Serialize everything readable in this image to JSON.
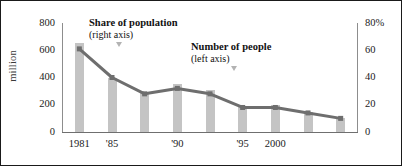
{
  "chart_data": {
    "type": "bar",
    "title": "",
    "categories": [
      "1981",
      "1984",
      "1987",
      "1990",
      "1993",
      "1996",
      "1999",
      "2002",
      "2004"
    ],
    "x_tick_labels": [
      "1981",
      "'85",
      "'90",
      "'95",
      "2000"
    ],
    "x_tick_categories": [
      "1981",
      "1984",
      "1990",
      "1996",
      "1999"
    ],
    "ylabel": "million",
    "ylim": [
      0,
      800
    ],
    "y_ticks": [
      "0",
      "200",
      "400",
      "600",
      "800"
    ],
    "y2label": "",
    "y2lim": [
      0,
      80
    ],
    "y2_ticks": [
      "0",
      "20",
      "40",
      "60",
      "80%"
    ],
    "grid": false,
    "legend_position": "inline-annotations",
    "series": [
      {
        "name": "Number of people",
        "axis": "left",
        "unit": "million",
        "render": "bar",
        "color": "#c4c4c4",
        "values": [
          650,
          400,
          290,
          350,
          310,
          190,
          200,
          150,
          100
        ]
      },
      {
        "name": "Share of population",
        "axis": "right",
        "unit": "%",
        "render": "line",
        "color": "#6e6e6e",
        "values": [
          61,
          40,
          28,
          32,
          28,
          18,
          18,
          14,
          10
        ]
      }
    ],
    "annotations": [
      {
        "id": "share",
        "title": "Share of population",
        "subtitle": "(right axis)",
        "marker": "down-triangle"
      },
      {
        "id": "number",
        "title": "Number of people",
        "subtitle": "(left axis)",
        "marker": "down-triangle"
      }
    ]
  }
}
